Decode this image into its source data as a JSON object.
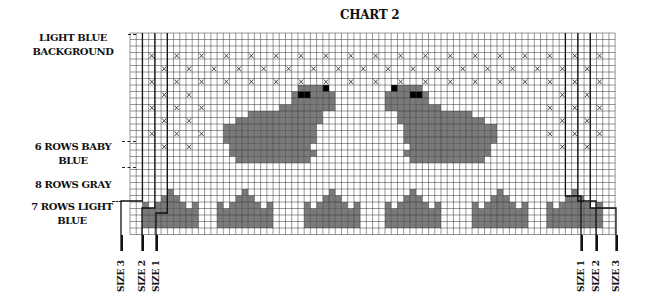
{
  "chart": {
    "title": "CHART 2",
    "labels": {
      "background": [
        "LIGHT BLUE",
        "BACKGROUND"
      ],
      "baby_blue": [
        "6 ROWS BABY",
        "BLUE"
      ],
      "gray": [
        "8 ROWS GRAY"
      ],
      "light_blue": [
        "7 ROWS LIGHT",
        "BLUE"
      ]
    },
    "size_markers_left": [
      "SIZE 3",
      "SIZE 2",
      "SIZE 1"
    ],
    "size_markers_right": [
      "SIZE 1",
      "SIZE 2",
      "SIZE 3"
    ]
  },
  "grid": {
    "x0": 130,
    "y0": 33,
    "cols": 78,
    "rows": 31,
    "cell_w": 6.22,
    "cell_h": 6.5,
    "line_color": "#333333",
    "fill_color": "#7a7a7a",
    "eye_color": "#000000"
  },
  "chart_data": {
    "type": "table",
    "title": "CHART 2",
    "legend": [
      "LIGHT BLUE BACKGROUND",
      "6 ROWS BABY BLUE",
      "8 ROWS GRAY",
      "7 ROWS LIGHT BLUE"
    ],
    "size_markers": [
      "SIZE 1",
      "SIZE 2",
      "SIZE 3"
    ]
  }
}
